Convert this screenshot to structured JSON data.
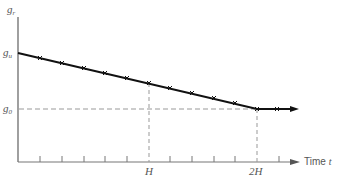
{
  "diagram": {
    "y_axis_label": {
      "symbol": "g",
      "sub": "r"
    },
    "start_level_label": {
      "symbol": "g",
      "sub": "u"
    },
    "end_level_label": {
      "symbol": "g",
      "sub": "0"
    },
    "x_axis_label": {
      "text": "Time",
      "symbol": "t"
    },
    "x_ticks": {
      "H": "H",
      "2H": "2H"
    },
    "colors": {
      "line": "#111111",
      "axis": "#777777",
      "dash": "#999999",
      "text": "#555555"
    },
    "curve": {
      "description": "linear decrease from g_u at t=0 to g_0 at t=2H, then constant g_0",
      "points": [
        [
          0,
          "g_u"
        ],
        [
          "2H",
          "g_0"
        ],
        [
          ">2H",
          "g_0"
        ]
      ]
    },
    "tick_count": 12
  }
}
